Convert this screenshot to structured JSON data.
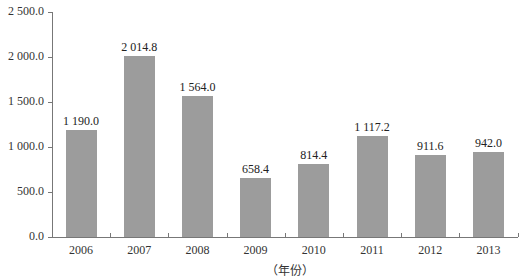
{
  "chart_data": {
    "type": "bar",
    "title": "",
    "xlabel": "（年份）",
    "ylabel": "",
    "categories": [
      "2006",
      "2007",
      "2008",
      "2009",
      "2010",
      "2011",
      "2012",
      "2013"
    ],
    "values": [
      1190.0,
      2014.8,
      1564.0,
      658.4,
      814.4,
      1117.2,
      911.6,
      942.0
    ],
    "value_labels": [
      "1 190.0",
      "2 014.8",
      "1 564.0",
      "658.4",
      "814.4",
      "1 117.2",
      "911.6",
      "942.0"
    ],
    "ylim": [
      0,
      2500
    ],
    "yticks": [
      0,
      500,
      1000,
      1500,
      2000,
      2500
    ],
    "ytick_labels": [
      "0.0",
      "500.0",
      "1 000.0",
      "1 500.0",
      "2 000.0",
      "2 500.0"
    ],
    "grid": false,
    "legend": null,
    "bar_color": "#9c9c9c"
  }
}
